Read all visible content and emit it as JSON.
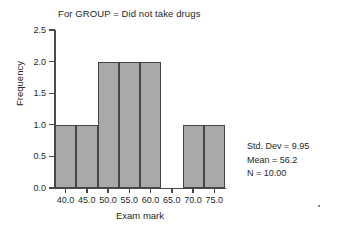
{
  "chart_data": {
    "type": "bar",
    "title": "For GROUP = Did not take drugs",
    "xlabel": "Exam mark",
    "ylabel": "Frequency",
    "categories": [
      "40.0",
      "45.0",
      "50.0",
      "55.0",
      "60.0",
      "65.0",
      "70.0",
      "75.0"
    ],
    "x": [
      40,
      45,
      50,
      55,
      60,
      65,
      70,
      75
    ],
    "values": [
      1,
      1,
      2,
      2,
      2,
      0,
      1,
      1
    ],
    "bin_width": 5,
    "xlim": [
      37.5,
      77.5
    ],
    "ylim": [
      0,
      2.5
    ],
    "ytick_labels": [
      "0.0",
      "0.5",
      "1.0",
      "1.5",
      "2.0",
      "2.5"
    ],
    "ytick_values": [
      0,
      0.5,
      1,
      1.5,
      2,
      2.5
    ],
    "xtick_labels": [
      "40.0",
      "45.0",
      "50.0",
      "55.0",
      "60.0",
      "65.0",
      "70.0",
      "75.0"
    ],
    "grid": false,
    "legend": false,
    "bar_color": "#a9a9a9",
    "bar_border_color": "#454545",
    "axis_color": "#4a4a4a",
    "annotations": [
      "Std. Dev = 9.95",
      "Mean = 56.2",
      "N = 10.00"
    ]
  },
  "stats": {
    "std_dev_label": "Std. Dev = 9.95",
    "mean_label": "Mean = 56.2",
    "n_label": "N = 10.00"
  }
}
